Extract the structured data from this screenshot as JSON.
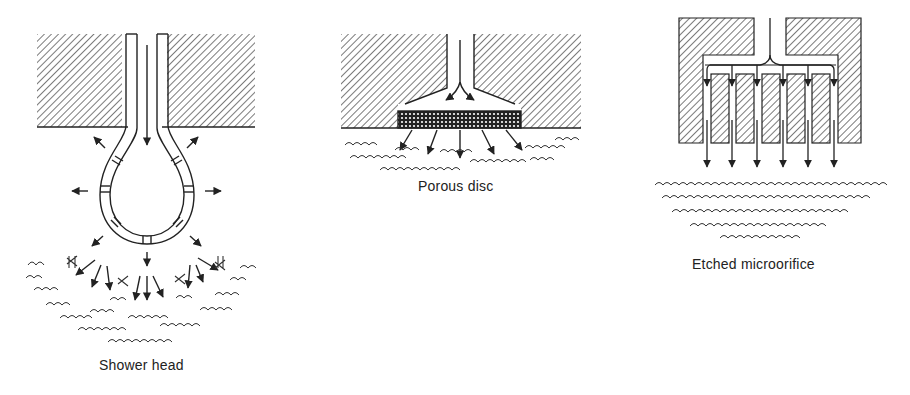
{
  "figure": {
    "panels": [
      {
        "id": "shower-head",
        "caption": "Shower head"
      },
      {
        "id": "porous-disc",
        "caption": "Porous disc"
      },
      {
        "id": "etched-microorifice",
        "caption": "Etched microorifice"
      }
    ],
    "colors": {
      "ink": "#222222",
      "background": "#ffffff",
      "hatch": "#333333"
    }
  }
}
